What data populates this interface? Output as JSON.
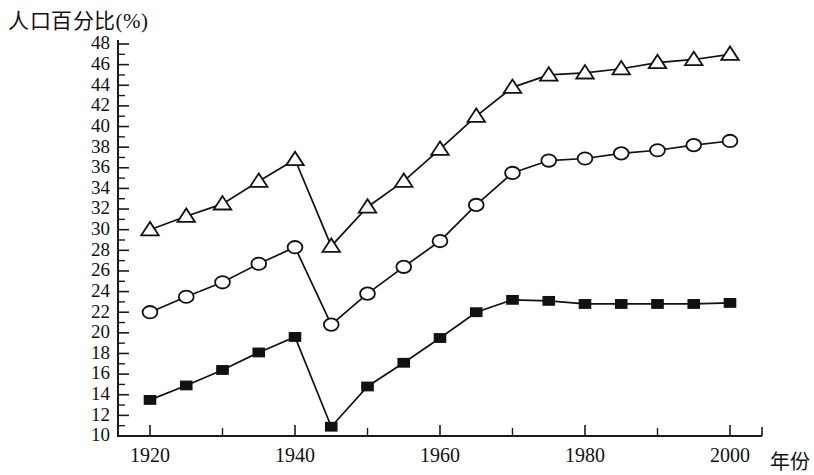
{
  "chart_data": {
    "type": "line",
    "title": "人口百分比(%)",
    "ylabel": "人口百分比(%)",
    "xlabel": "年份",
    "grid": false,
    "legend": "none",
    "xlim": [
      1915,
      2005
    ],
    "ylim": [
      10,
      48
    ],
    "yticks": [
      10,
      12,
      14,
      16,
      18,
      20,
      22,
      24,
      26,
      28,
      30,
      32,
      34,
      36,
      38,
      40,
      42,
      44,
      46,
      48
    ],
    "xticks": [
      1920,
      1940,
      1960,
      1980,
      2000
    ],
    "xticks_minor": [
      1930,
      1950,
      1970,
      1990
    ],
    "x": [
      1920,
      1925,
      1930,
      1935,
      1940,
      1945,
      1950,
      1955,
      1960,
      1965,
      1970,
      1975,
      1980,
      1985,
      1990,
      1995,
      2000
    ],
    "series": [
      {
        "name": "triangle-series",
        "marker": "open-triangle",
        "values": [
          30.0,
          31.3,
          32.5,
          34.7,
          36.8,
          28.4,
          32.2,
          34.7,
          37.8,
          41.0,
          43.8,
          45.0,
          45.2,
          45.6,
          46.2,
          46.5,
          47.0
        ]
      },
      {
        "name": "circle-series",
        "marker": "open-circle",
        "values": [
          22.0,
          23.5,
          24.9,
          26.7,
          28.3,
          20.8,
          23.8,
          26.4,
          28.9,
          32.4,
          35.5,
          36.7,
          36.9,
          37.4,
          37.7,
          38.2,
          38.6
        ]
      },
      {
        "name": "square-series",
        "marker": "filled-square",
        "values": [
          13.5,
          14.9,
          16.4,
          18.1,
          19.6,
          10.9,
          14.8,
          17.1,
          19.5,
          22.0,
          23.2,
          23.1,
          22.8,
          22.8,
          22.8,
          22.8,
          22.9
        ]
      }
    ]
  },
  "axes": {
    "y_tick_labels": [
      "10",
      "12",
      "14",
      "16",
      "18",
      "20",
      "22",
      "24",
      "26",
      "28",
      "30",
      "32",
      "34",
      "36",
      "38",
      "40",
      "42",
      "44",
      "46",
      "48"
    ],
    "x_tick_labels": [
      "1920",
      "1940",
      "1960",
      "1980",
      "2000"
    ],
    "x_axis_name": "年份",
    "y_axis_name": "人口百分比(%)"
  },
  "colors": {
    "ink": "#111111",
    "background": "#ffffff"
  }
}
